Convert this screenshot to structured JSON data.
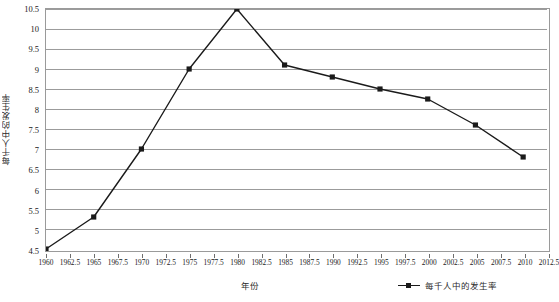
{
  "chart_data": {
    "type": "line",
    "title": "",
    "xlabel": "年份",
    "ylabel": "每千人中的发生率",
    "legend": [
      {
        "name": "每千人中的发生率",
        "marker": "square",
        "color": "#1a1a1a"
      }
    ],
    "legend_position": "bottom-right",
    "grid": true,
    "grid_axis": "y",
    "xlim": [
      1960,
      2012.5
    ],
    "ylim": [
      4.5,
      10.5
    ],
    "x_tick_labels": [
      "1960",
      "1962.5",
      "1965",
      "1967.5",
      "1970",
      "1972.5",
      "1975",
      "1977.5",
      "1980",
      "1982.5",
      "1985",
      "1987.5",
      "1990",
      "1992.5",
      "1995",
      "1997.5",
      "2000",
      "2002.5",
      "2005",
      "2007.5",
      "2010",
      "2012.5"
    ],
    "x_tick_values": [
      1960,
      1962.5,
      1965,
      1967.5,
      1970,
      1972.5,
      1975,
      1977.5,
      1980,
      1982.5,
      1985,
      1987.5,
      1990,
      1992.5,
      1995,
      1997.5,
      2000,
      2002.5,
      2005,
      2007.5,
      2010,
      2012.5
    ],
    "y_tick_labels": [
      "4.5",
      "5",
      "5.5",
      "6",
      "6.5",
      "7",
      "7.5",
      "8",
      "8.5",
      "9",
      "9.5",
      "10",
      "10.5"
    ],
    "y_tick_values": [
      4.5,
      5,
      5.5,
      6,
      6.5,
      7,
      7.5,
      8,
      8.5,
      9,
      9.5,
      10,
      10.5
    ],
    "series": [
      {
        "name": "每千人中的发生率",
        "x": [
          1960,
          1965,
          1970,
          1975,
          1980,
          1985,
          1990,
          1995,
          2000,
          2005,
          2010
        ],
        "values": [
          4.5,
          5.3,
          7.0,
          9.0,
          10.5,
          9.1,
          8.8,
          8.5,
          8.25,
          7.6,
          6.8
        ]
      }
    ]
  },
  "colors": {
    "line": "#1a1a1a",
    "marker": "#1a1a1a",
    "grid": "#9a9a9a",
    "axis": "#9a9a9a",
    "background": "#ffffff",
    "text": "#1a1a1a"
  }
}
